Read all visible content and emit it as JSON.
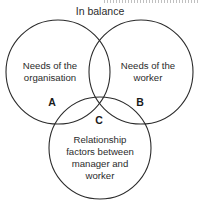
{
  "diagram": {
    "title": "In balance",
    "type": "venn-3-circle",
    "background_color": "#ffffff",
    "stroke_color": "#2b2b2b",
    "text_color": "#2b2b2b",
    "label_color": "#1a1a1a",
    "circles": [
      {
        "key": "A",
        "name": "organisation-circle",
        "cx": 58,
        "cy": 72,
        "r": 52,
        "lines": [
          "Needs of the",
          "organisation"
        ],
        "line1": "Needs of the",
        "line2": "organisation",
        "text_x": 50,
        "text_y": 66
      },
      {
        "key": "B",
        "name": "worker-circle",
        "cx": 141,
        "cy": 72,
        "r": 52,
        "lines": [
          "Needs of the",
          "worker"
        ],
        "line1": "Needs of the",
        "line2": "worker",
        "text_x": 148,
        "text_y": 66
      },
      {
        "key": "C",
        "name": "relationship-circle",
        "cx": 100,
        "cy": 148,
        "r": 51,
        "lines": [
          "Relationship",
          "factors between",
          "manager and",
          "worker"
        ],
        "line1": "Relationship",
        "line2": "factors between",
        "line3": "manager and",
        "line4": "worker",
        "text_x": 100,
        "text_y": 140
      }
    ],
    "region_keys": [
      {
        "label": "A",
        "x": 52,
        "y": 103
      },
      {
        "label": "B",
        "x": 140,
        "y": 103
      },
      {
        "label": "C",
        "x": 99,
        "y": 121
      }
    ],
    "title_position": {
      "x": 100,
      "y": 12
    }
  }
}
